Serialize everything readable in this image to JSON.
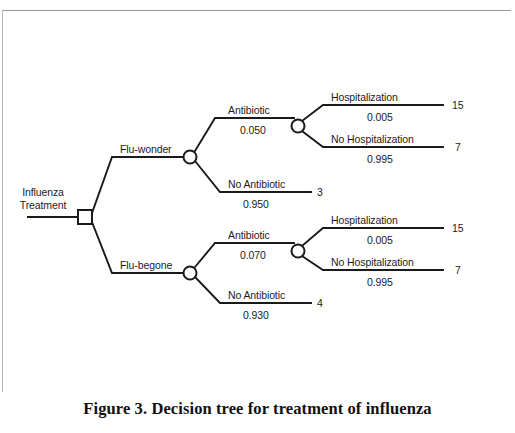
{
  "figure": {
    "caption": "Figure 3.  Decision tree for treatment of influenza",
    "line_color": "#1a1a1a",
    "text_color": "#1c1c1c",
    "background": "#ffffff"
  },
  "tree": {
    "root": {
      "label": "Influenza\nTreatment",
      "label_line1": "Influenza",
      "label_line2": "Treatment",
      "node_type": "decision-square"
    },
    "branches": [
      {
        "label": "Flu-wonder",
        "node_type": "chance-circle",
        "children": [
          {
            "label": "Antibiotic",
            "probability": "0.050",
            "node_type": "chance-circle",
            "children": [
              {
                "label": "Hospitalization",
                "probability": "0.005",
                "payoff": "15",
                "node_type": "terminal"
              },
              {
                "label": "No Hospitalization",
                "probability": "0.995",
                "payoff": "7",
                "node_type": "terminal"
              }
            ]
          },
          {
            "label": "No Antibiotic",
            "probability": "0.950",
            "payoff": "3",
            "node_type": "terminal"
          }
        ]
      },
      {
        "label": "Flu-begone",
        "node_type": "chance-circle",
        "children": [
          {
            "label": "Antibiotic",
            "probability": "0.070",
            "node_type": "chance-circle",
            "children": [
              {
                "label": "Hospitalization",
                "probability": "0.005",
                "payoff": "15",
                "node_type": "terminal"
              },
              {
                "label": "No Hospitalization",
                "probability": "0.995",
                "payoff": "7",
                "node_type": "terminal"
              }
            ]
          },
          {
            "label": "No Antibiotic",
            "probability": "0.930",
            "payoff": "4",
            "node_type": "terminal"
          }
        ]
      }
    ]
  }
}
